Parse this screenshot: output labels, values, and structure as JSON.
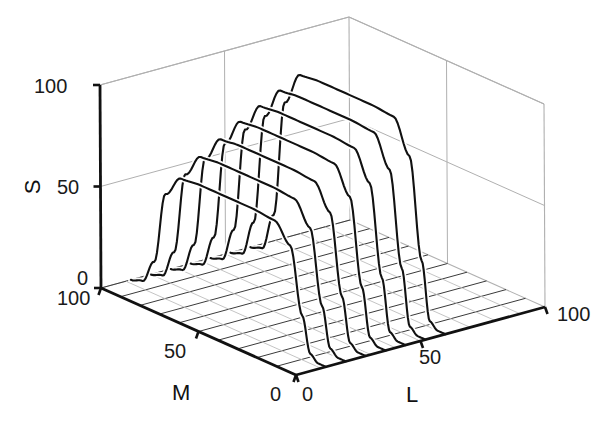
{
  "figure": {
    "type": "3d-line-plot",
    "background": "#ffffff",
    "ink_color": "#111111",
    "grid_color": "#9a9a9a",
    "frame_color": "#b0b0b0"
  },
  "chart_data": {
    "type": "line",
    "title": "",
    "subtitle": "",
    "projection": "3d-axonometric",
    "grid": true,
    "legend": null,
    "axes": {
      "x": {
        "label": "L",
        "ticks": [
          0,
          50,
          100
        ],
        "tick_labels": [
          "0",
          "50",
          "100"
        ],
        "range": [
          0,
          100
        ]
      },
      "y": {
        "label": "M",
        "ticks": [
          0,
          50,
          100
        ],
        "tick_labels": [
          "0",
          "50",
          "100"
        ],
        "range": [
          0,
          100
        ]
      },
      "z": {
        "label": "S",
        "ticks": [
          0,
          50,
          100
        ],
        "tick_labels": [
          "0",
          "50",
          "100"
        ],
        "range": [
          0,
          100
        ]
      }
    },
    "xlabel": "L",
    "ylabel": "M",
    "zlabel": "S",
    "floor_grid_lines_M": [
      0,
      10,
      20,
      30,
      40,
      50,
      60,
      70,
      80,
      90,
      100
    ],
    "series": [
      {
        "name": "L=12",
        "L": 12,
        "plateau_S": 62,
        "values": [
          0,
          0,
          3,
          20,
          52,
          61,
          62,
          62,
          62,
          61,
          50,
          14,
          2,
          0
        ]
      },
      {
        "name": "L=20",
        "L": 20,
        "plateau_S": 70,
        "values": [
          0,
          0,
          3,
          22,
          58,
          69,
          70,
          70,
          70,
          69,
          57,
          16,
          2,
          0
        ]
      },
      {
        "name": "L=28",
        "L": 28,
        "plateau_S": 76,
        "values": [
          0,
          0,
          3,
          24,
          63,
          75,
          76,
          76,
          76,
          75,
          62,
          17,
          2,
          0
        ]
      },
      {
        "name": "L=36",
        "L": 36,
        "plateau_S": 82,
        "values": [
          0,
          0,
          3,
          26,
          68,
          81,
          82,
          82,
          82,
          81,
          67,
          18,
          2,
          0
        ]
      },
      {
        "name": "L=44",
        "L": 44,
        "plateau_S": 87,
        "values": [
          0,
          0,
          3,
          28,
          72,
          86,
          87,
          87,
          87,
          86,
          71,
          19,
          2,
          0
        ]
      },
      {
        "name": "L=52",
        "L": 52,
        "plateau_S": 92,
        "values": [
          0,
          0,
          3,
          30,
          76,
          91,
          92,
          92,
          92,
          91,
          75,
          20,
          2,
          0
        ]
      },
      {
        "name": "L=60",
        "L": 60,
        "plateau_S": 97,
        "values": [
          0,
          0,
          3,
          31,
          80,
          96,
          97,
          97,
          97,
          96,
          79,
          21,
          2,
          0
        ]
      }
    ],
    "series_M_samples": [
      0,
      4,
      8,
      12,
      18,
      26,
      38,
      52,
      64,
      74,
      82,
      88,
      94,
      100
    ],
    "annotations": []
  },
  "labels": {
    "s_100": "100",
    "s_50": "50",
    "s_0": "0",
    "s_title": "S",
    "m_100": "100",
    "m_50": "50",
    "m_0": "0",
    "m_title": "M",
    "l_0": "0",
    "l_50": "50",
    "l_100": "100",
    "l_title": "L"
  }
}
